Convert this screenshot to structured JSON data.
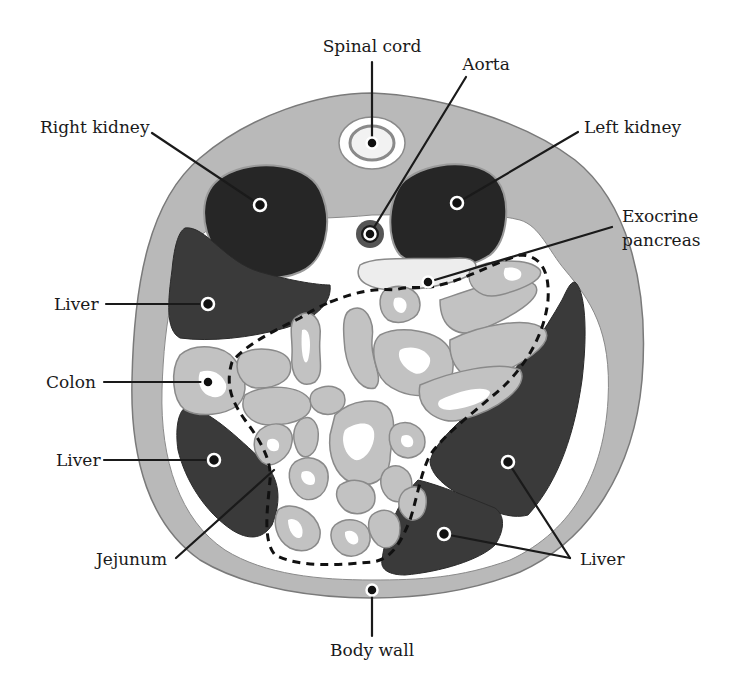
{
  "figure": {
    "type": "anatomical cross-section",
    "colors": {
      "body_wall": "#b9b9b9",
      "organ_dark": "#3a3a3a",
      "kidney": "#262626",
      "intestine": "#c2c2c2",
      "lumen": "#ffffff",
      "leader_line": "#1a1a1a"
    }
  },
  "labels": {
    "spinal_cord": "Spinal cord",
    "aorta": "Aorta",
    "right_kidney": "Right kidney",
    "left_kidney": "Left kidney",
    "exocrine_pancreas_line1": "Exocrine",
    "exocrine_pancreas_line2": "pancreas",
    "liver_upper_left": "Liver",
    "colon": "Colon",
    "liver_lower_left": "Liver",
    "jejunum": "Jejunum",
    "liver_right": "Liver",
    "body_wall": "Body wall"
  }
}
